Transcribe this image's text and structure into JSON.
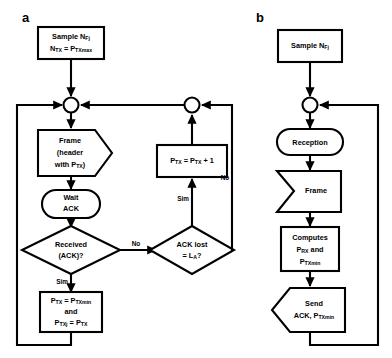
{
  "figure": {
    "panels": [
      {
        "id": "a",
        "label": "a",
        "role": "transmitter-flowchart",
        "nodes": [
          {
            "key": "start",
            "shape": "rectangle",
            "lines": [
              {
                "text": "Sample N",
                "sub": "Fj"
              },
              {
                "text": "N",
                "sub": "TX",
                "text2": " = P",
                "sub2": "TXmax"
              }
            ]
          },
          {
            "key": "junction_left",
            "shape": "circle",
            "lines": []
          },
          {
            "key": "frame",
            "shape": "pentagon-right",
            "lines": [
              {
                "text": "Frame"
              },
              {
                "text": "(header"
              },
              {
                "text": "with P",
                "sub": "TX",
                "text2": ")"
              }
            ]
          },
          {
            "key": "wait_ack",
            "shape": "stadium",
            "lines": [
              {
                "text": "Wait"
              },
              {
                "text": "ACK"
              }
            ]
          },
          {
            "key": "received_ack",
            "shape": "diamond",
            "lines": [
              {
                "text": "Received"
              },
              {
                "text": "(ACK)?"
              }
            ]
          },
          {
            "key": "set_power",
            "shape": "rectangle",
            "lines": [
              {
                "text": "P",
                "sub": "TX",
                "text2": " = P",
                "sub2": "TXmin"
              },
              {
                "text": "and"
              },
              {
                "text": "P",
                "sub": "TXj",
                "text2": " = P",
                "sub2": "TX"
              }
            ]
          },
          {
            "key": "junction_right",
            "shape": "circle",
            "lines": []
          },
          {
            "key": "increment_power",
            "shape": "rectangle",
            "lines": [
              {
                "text": "P",
                "sub": "TX",
                "text2": " = P",
                "sub2": "TX",
                "text3": " + 1"
              }
            ]
          },
          {
            "key": "ack_lost",
            "shape": "diamond",
            "lines": [
              {
                "text": "ACK lost"
              },
              {
                "text": "= L",
                "sub": "A",
                "text2": "?"
              }
            ]
          }
        ],
        "edge_labels": [
          {
            "key": "received-no",
            "text": "No"
          },
          {
            "key": "received-sim",
            "text": "Sim"
          },
          {
            "key": "ack-lost-sim",
            "text": "Sim"
          },
          {
            "key": "ack-lost-no",
            "text": "No"
          }
        ]
      },
      {
        "id": "b",
        "label": "b",
        "role": "receiver-flowchart",
        "nodes": [
          {
            "key": "start",
            "shape": "rectangle",
            "lines": [
              {
                "text": "Sample N",
                "sub": "Fj"
              }
            ]
          },
          {
            "key": "junction",
            "shape": "circle",
            "lines": []
          },
          {
            "key": "reception",
            "shape": "stadium",
            "lines": [
              {
                "text": "Reception"
              }
            ]
          },
          {
            "key": "frame",
            "shape": "chevron-in",
            "lines": [
              {
                "text": "Frame"
              }
            ]
          },
          {
            "key": "computes",
            "shape": "rectangle",
            "lines": [
              {
                "text": "Computes"
              },
              {
                "text": "P",
                "sub": "RX",
                "text2": " and"
              },
              {
                "text": "P",
                "sub": "TXmin"
              }
            ]
          },
          {
            "key": "send_ack",
            "shape": "pentagon-left",
            "lines": [
              {
                "text": "Send"
              },
              {
                "text": "ACK, P",
                "sub": "TXmin"
              }
            ]
          }
        ],
        "edge_labels": []
      }
    ],
    "colors": {
      "stroke": "#000000",
      "fill": "#ffffff",
      "text": "#000000"
    }
  }
}
